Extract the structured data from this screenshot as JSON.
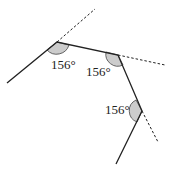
{
  "diagram": {
    "type": "polygon exterior angles",
    "angles": [
      {
        "label": "156°",
        "vertex": "A"
      },
      {
        "label": "156°",
        "vertex": "B"
      },
      {
        "label": "156°",
        "vertex": "C"
      }
    ],
    "colors": {
      "line": "#222222",
      "arc_fill": "#cccccc"
    }
  }
}
